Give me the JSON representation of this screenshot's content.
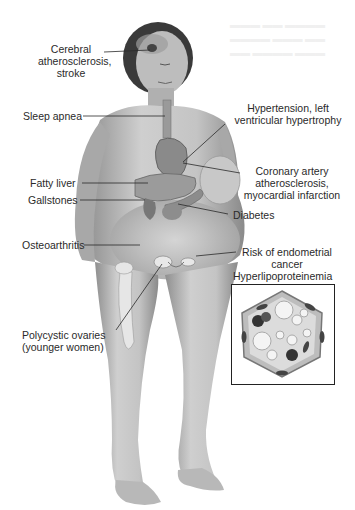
{
  "figure": {
    "labels": {
      "cerebral": [
        "Cerebral",
        "atherosclerosis,",
        "stroke"
      ],
      "sleep_apnea": "Sleep apnea",
      "hypertension": [
        "Hypertension, left",
        "ventricular hypertrophy"
      ],
      "coronary": [
        "Coronary artery",
        "atherosclerosis,",
        "myocardial infarction"
      ],
      "fatty_liver": "Fatty liver",
      "gallstones": "Gallstones",
      "diabetes": "Diabetes",
      "osteoarthritis": "Osteoarthritis",
      "endometrial": [
        "Risk of endometrial",
        "cancer"
      ],
      "hyperlipo": "Hyperlipoproteinemia",
      "polycystic": [
        "Polycystic ovaries",
        "(younger women)"
      ]
    },
    "inset": {
      "title": "Hyperlipoproteinemia",
      "content": "vessel cross-section with lipid droplets"
    },
    "colors": {
      "skin": "#c9c9c9",
      "skin_shadow": "#9a9a9a",
      "hair": "#3a3a3a",
      "organ": "#8a8a8a",
      "line": "#2a2a2a"
    }
  }
}
